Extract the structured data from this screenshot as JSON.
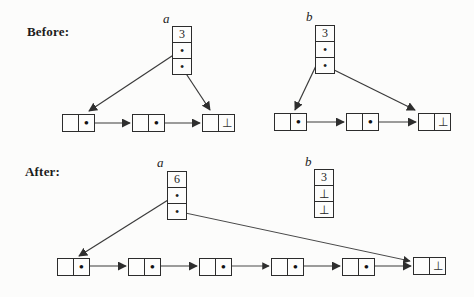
{
  "labels": {
    "before": "Before:",
    "after": "After:"
  },
  "symbols": {
    "pointer": "•"
  },
  "before": {
    "a": {
      "name": "a",
      "cells": [
        "3",
        "•",
        "•"
      ]
    },
    "b": {
      "name": "b",
      "cells": [
        "3",
        "•",
        "•"
      ]
    },
    "list_a": {
      "node_count": 3,
      "last_cell": "⊥"
    },
    "list_b": {
      "node_count": 3,
      "last_cell": "⊥"
    }
  },
  "after": {
    "a": {
      "name": "a",
      "cells": [
        "6",
        "•",
        "•"
      ]
    },
    "b": {
      "name": "b",
      "cells": [
        "3",
        "⊥",
        "⊥"
      ]
    },
    "list": {
      "node_count": 6,
      "last_cell": "⊥"
    }
  }
}
